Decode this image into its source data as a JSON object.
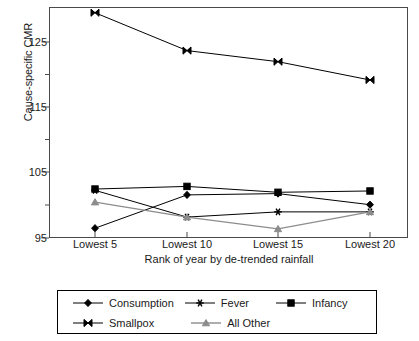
{
  "chart_data": {
    "type": "line",
    "title": "",
    "xlabel": "Rank of year by de-trended rainfall",
    "ylabel": "Cause-specific CMR",
    "categories": [
      "Lowest 5",
      "Lowest 10",
      "Lowest 15",
      "Lowest 20"
    ],
    "ylim": [
      95,
      130
    ],
    "yticks": [
      95,
      105,
      115,
      125
    ],
    "yticks_minor": [
      100,
      110,
      120
    ],
    "grid": false,
    "legend_position": "bottom",
    "series": [
      {
        "name": "Consumption",
        "marker": "diamond",
        "color": "#000000",
        "values": [
          96.5,
          101.6,
          101.8,
          100.1
        ]
      },
      {
        "name": "Fever",
        "marker": "asterisk",
        "color": "#000000",
        "values": [
          102.3,
          98.2,
          99.0,
          99.0
        ]
      },
      {
        "name": "Infancy",
        "marker": "square",
        "color": "#000000",
        "values": [
          102.5,
          102.9,
          102.0,
          102.2
        ]
      },
      {
        "name": "Smallpox",
        "marker": "bowtie",
        "color": "#000000",
        "values": [
          129.5,
          123.7,
          122.0,
          119.2
        ]
      },
      {
        "name": "All Other",
        "marker": "triangle",
        "color": "#8c8c8c",
        "values": [
          100.5,
          98.2,
          96.4,
          99.0
        ]
      }
    ]
  },
  "axis": {
    "y_tick_labels": [
      "125",
      "115",
      "105",
      "95"
    ],
    "x_tick_labels": [
      "Lowest 5",
      "Lowest 10",
      "Lowest 15",
      "Lowest 20"
    ],
    "y_title": "Cause-specific CMR",
    "x_title": "Rank of year by de-trended rainfall"
  },
  "legend": {
    "row1": [
      {
        "label": "Consumption",
        "marker": "diamond"
      },
      {
        "label": "Fever",
        "marker": "asterisk"
      },
      {
        "label": "Infancy",
        "marker": "square"
      }
    ],
    "row2": [
      {
        "label": "Smallpox",
        "marker": "bowtie"
      },
      {
        "label": "All Other",
        "marker": "triangle"
      }
    ]
  }
}
